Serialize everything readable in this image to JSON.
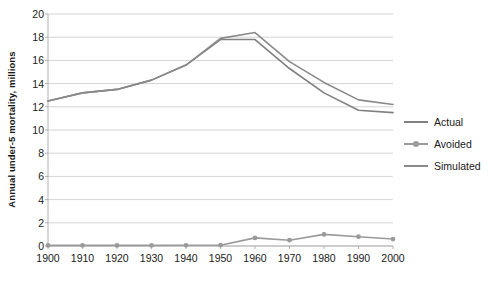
{
  "chart_data": {
    "type": "line",
    "title": "",
    "xlabel": "",
    "ylabel": "Annual under-5 mortality, millions",
    "categories": [
      1900,
      1910,
      1920,
      1930,
      1940,
      1950,
      1960,
      1970,
      1980,
      1990,
      2000
    ],
    "xtick_labels": [
      "1900",
      "1910",
      "1920",
      "1930",
      "1940",
      "1950",
      "1960",
      "1970",
      "1980",
      "1990",
      "2000"
    ],
    "ytick_labels": [
      "0",
      "2",
      "4",
      "6",
      "8",
      "10",
      "12",
      "14",
      "16",
      "18",
      "20"
    ],
    "ytick_values": [
      0,
      2,
      4,
      6,
      8,
      10,
      12,
      14,
      16,
      18,
      20
    ],
    "ylim": [
      0,
      20
    ],
    "grid": "horizontal",
    "legend_position": "right",
    "series": [
      {
        "name": "Actual",
        "color": "#808080",
        "marker": "none",
        "values": [
          12.5,
          13.2,
          13.5,
          14.3,
          15.6,
          17.8,
          17.8,
          15.3,
          13.2,
          11.7,
          11.5
        ]
      },
      {
        "name": "Avoided",
        "color": "#9a9a9a",
        "marker": "circle",
        "values": [
          0.05,
          0.05,
          0.05,
          0.05,
          0.06,
          0.07,
          0.7,
          0.5,
          1.0,
          0.8,
          0.6
        ]
      },
      {
        "name": "Simulated",
        "color": "#8a8a8a",
        "marker": "none",
        "values": [
          12.5,
          13.2,
          13.5,
          14.3,
          15.6,
          17.9,
          18.4,
          15.9,
          14.1,
          12.6,
          12.2
        ]
      }
    ]
  },
  "legend": {
    "items": [
      {
        "label": "Actual"
      },
      {
        "label": "Avoided"
      },
      {
        "label": "Simulated"
      }
    ]
  },
  "style": {
    "gridline_color": "#d4d4d4",
    "axis_color": "#b0b0b0",
    "text_color": "#1a1a1a",
    "background": "#ffffff"
  }
}
